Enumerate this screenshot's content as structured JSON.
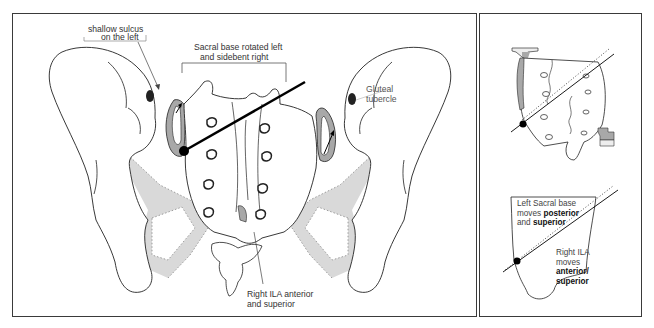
{
  "figure": {
    "main_panel": {
      "labels": {
        "shallow_sulcus_line1": "shallow sulcus",
        "shallow_sulcus_line2": "on the left",
        "sacral_base_line1": "Sacral base rotated left",
        "sacral_base_line2": "and sidebent right",
        "gluteal_line1": "Gluteal",
        "gluteal_line2": "tubercle",
        "right_ila_line1": "Right ILA anterior",
        "right_ila_line2": "and superior"
      }
    },
    "side_panel": {
      "lower_box": {
        "left_base_line1": "Left Sacral base",
        "left_base_line2_prefix": "moves ",
        "left_base_line2_bold": "posterior",
        "left_base_line3_prefix": "and ",
        "left_base_line3_bold": "superior",
        "right_ila_line1": "Right ILA",
        "right_ila_line2": "moves",
        "right_ila_line3_bold": "anterior/",
        "right_ila_line4_bold": "superior"
      }
    },
    "colors": {
      "outline": "#222222",
      "shade": "#d9d9d9",
      "joint_shade": "#a8a8a8",
      "axis": "#000000",
      "border": "#3a3a3a"
    }
  }
}
